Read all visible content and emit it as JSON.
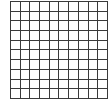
{
  "grid": {
    "rows": 10,
    "cols": 10,
    "line_color": "#3a3a3a",
    "cell_color": "#ffffff",
    "filled_cells": []
  }
}
